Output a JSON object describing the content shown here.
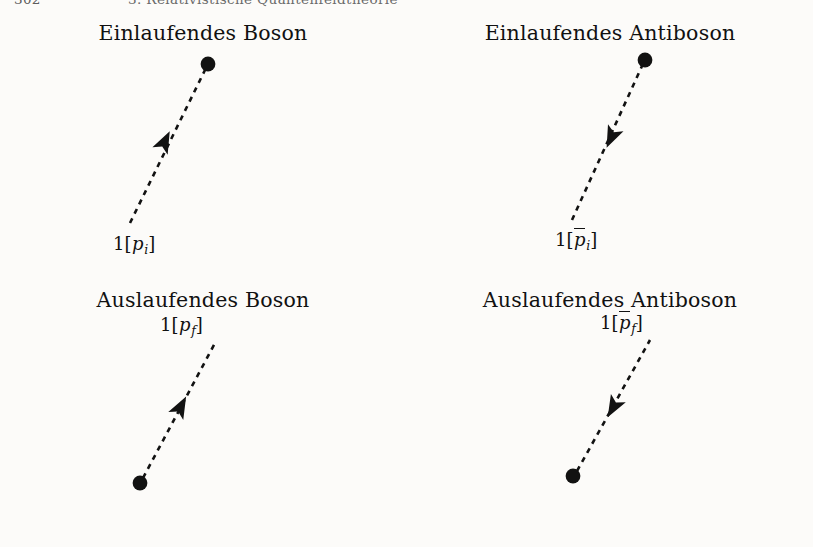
{
  "page": {
    "running_head": {
      "folio": "302",
      "chapter": "3. Relativistische Quantenfeldtheorie"
    },
    "background_color": "#fcfbf9",
    "ink_color": "#121212"
  },
  "panels": [
    {
      "key": "incoming-boson",
      "title": "Einlaufendes Boson",
      "momentum": {
        "prefix": "1[",
        "symbol": "p",
        "overbar": false,
        "subscript": "i",
        "suffix": "]",
        "plain": "1[p_i]"
      },
      "line": {
        "x1": 130,
        "y1": 215,
        "x2": 205,
        "y2": 62
      },
      "dot": {
        "cx": 208,
        "cy": 56,
        "r": 7.4,
        "position": "top-right"
      },
      "arrow": {
        "x": 164,
        "y": 135,
        "direction": "up-right",
        "points_toward": "vertex"
      }
    },
    {
      "key": "incoming-antiboson",
      "title": "Einlaufendes Antiboson",
      "momentum": {
        "prefix": "1[",
        "symbol": "p",
        "overbar": true,
        "subscript": "i",
        "suffix": "]",
        "plain": "1[pbar_i]"
      },
      "line": {
        "x1": 165,
        "y1": 212,
        "x2": 235,
        "y2": 58
      },
      "dot": {
        "cx": 238,
        "cy": 52,
        "r": 7.4,
        "position": "top-right"
      },
      "arrow": {
        "x": 205,
        "y": 128,
        "direction": "down-left",
        "points_toward": "away-from-vertex"
      }
    },
    {
      "key": "outgoing-boson",
      "title": "Auslaufendes Boson",
      "momentum": {
        "prefix": "1[",
        "symbol": "p",
        "overbar": false,
        "subscript": "f",
        "suffix": "]",
        "plain": "1[p_f]"
      },
      "line": {
        "x1": 143,
        "y1": 203,
        "x2": 215,
        "y2": 68
      },
      "dot": {
        "cx": 140,
        "cy": 208,
        "r": 7.4,
        "position": "bottom-left"
      },
      "arrow": {
        "x": 180,
        "y": 133,
        "direction": "up-right",
        "points_toward": "away-from-vertex"
      }
    },
    {
      "key": "outgoing-antiboson",
      "title": "Auslaufendes Antiboson",
      "momentum": {
        "prefix": "1[",
        "symbol": "p",
        "overbar": true,
        "subscript": "f",
        "suffix": "]",
        "plain": "1[pbar_f]"
      },
      "line": {
        "x1": 170,
        "y1": 196,
        "x2": 243,
        "y2": 65
      },
      "dot": {
        "cx": 166,
        "cy": 201,
        "r": 7.4,
        "position": "bottom-left"
      },
      "arrow": {
        "x": 207,
        "y": 131,
        "direction": "down-left",
        "points_toward": "vertex"
      }
    }
  ]
}
